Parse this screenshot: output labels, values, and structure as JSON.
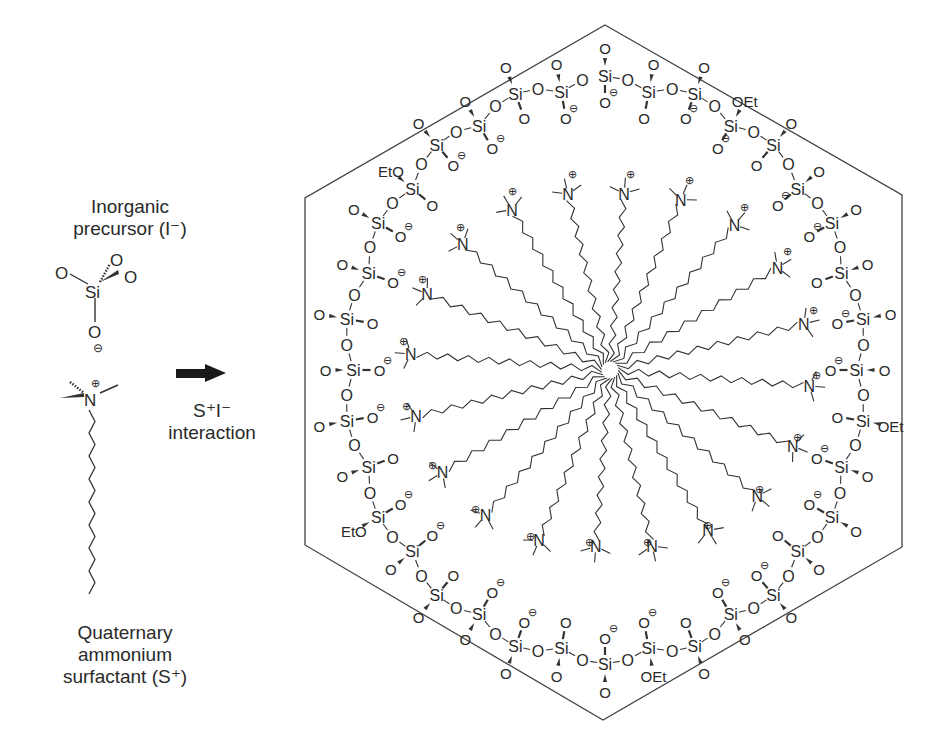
{
  "figure": {
    "left_panel": {
      "precursor_label": [
        "Inorganic",
        "precursor (I⁻)"
      ],
      "surfactant_label": [
        "Quaternary",
        "ammonium",
        "surfactant (S⁺)"
      ],
      "precursor_molecule": {
        "center": "Si",
        "substituents": [
          "O",
          "O",
          "O",
          "O⁻"
        ]
      },
      "surfactant_molecule": {
        "head": "N⁺",
        "methyl_groups": 3,
        "tail_segments": 16
      }
    },
    "arrow": {
      "icon": "right-arrow-icon",
      "label": [
        "S⁺I⁻",
        "interaction"
      ]
    },
    "micelle": {
      "shape": "hexagon",
      "hexagon_vertices": [
        [
          605,
          25
        ],
        [
          902,
          195
        ],
        [
          902,
          547
        ],
        [
          603,
          720
        ],
        [
          305,
          545
        ],
        [
          305,
          198
        ]
      ],
      "center": [
        610,
        370
      ],
      "surfactant_count": 20,
      "head_label": "N",
      "head_charge": "⊕",
      "silicate_unit": "Si",
      "bridging_oxygen": "O",
      "terminal_groups": [
        "O",
        "O⁻",
        "OEt",
        "EtO"
      ],
      "silicate_ring_count": 36
    },
    "colors": {
      "line": "#333333",
      "text": "#2a2a2a",
      "arrow": "#1a1a1a",
      "background": "#ffffff"
    }
  }
}
